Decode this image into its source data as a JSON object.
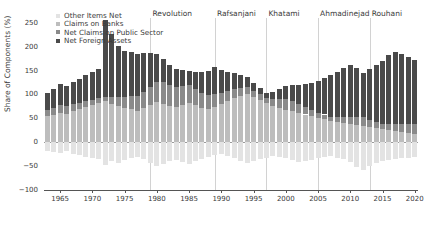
{
  "chart_data": {
    "type": "bar",
    "subtype": "stacked-bar",
    "title": "",
    "xlabel": "",
    "ylabel": "Share of Components (%)",
    "ylim": [
      -100,
      260
    ],
    "yticks": [
      -100,
      -50,
      0,
      50,
      100,
      150,
      200,
      250
    ],
    "xlim": [
      1962.5,
      2020.5
    ],
    "xticks": [
      1965,
      1970,
      1975,
      1980,
      1985,
      1990,
      1995,
      2000,
      2005,
      2010,
      2015,
      2020
    ],
    "grid": false,
    "legend_position": "top-left",
    "colors": {
      "other_items_net": "#e3e3e3",
      "claims_on_banks": "#bdbdbd",
      "net_claims_public_sector": "#8a8a8a",
      "net_foreign_assets": "#4a4a4a",
      "axis": "#555555",
      "era_line": "#d2d2d2",
      "text": "#3a3a3a"
    },
    "series": [
      {
        "name": "Other Items Net",
        "key": "other_items_net",
        "values": [
          -18,
          -20,
          -22,
          -19,
          -24,
          -26,
          -30,
          -33,
          -36,
          -48,
          -40,
          -44,
          -38,
          -34,
          -30,
          -36,
          -44,
          -50,
          -46,
          -40,
          -38,
          -42,
          -46,
          -40,
          -36,
          -30,
          -26,
          -24,
          -28,
          -34,
          -40,
          -44,
          -40,
          -36,
          -32,
          -28,
          -30,
          -34,
          -38,
          -42,
          -40,
          -38,
          -34,
          -30,
          -28,
          -32,
          -36,
          -42,
          -52,
          -58,
          -50,
          -44,
          -40,
          -38,
          -36,
          -34,
          -32,
          -30
        ]
      },
      {
        "name": "Claims on Banks",
        "key": "claims_on_banks",
        "values": [
          55,
          58,
          62,
          60,
          66,
          70,
          74,
          78,
          82,
          86,
          80,
          76,
          72,
          70,
          66,
          72,
          78,
          84,
          80,
          76,
          74,
          78,
          82,
          78,
          72,
          70,
          74,
          80,
          86,
          92,
          96,
          100,
          94,
          88,
          82,
          76,
          72,
          68,
          66,
          62,
          58,
          54,
          50,
          48,
          44,
          42,
          40,
          38,
          36,
          34,
          32,
          30,
          28,
          26,
          24,
          22,
          20,
          18
        ]
      },
      {
        "name": "Net Claims on Public Sector",
        "key": "net_claims_public_sector",
        "values": [
          12,
          14,
          16,
          15,
          14,
          13,
          12,
          11,
          10,
          9,
          14,
          18,
          22,
          26,
          30,
          34,
          38,
          42,
          46,
          44,
          42,
          40,
          38,
          34,
          30,
          28,
          26,
          24,
          22,
          20,
          18,
          16,
          14,
          12,
          10,
          14,
          18,
          22,
          20,
          18,
          16,
          14,
          12,
          10,
          8,
          10,
          12,
          14,
          16,
          18,
          14,
          12,
          10,
          12,
          14,
          16,
          18,
          20
        ]
      },
      {
        "name": "Net Foreign Assets",
        "key": "net_foreign_assets",
        "values": [
          36,
          40,
          44,
          42,
          46,
          50,
          54,
          58,
          62,
          160,
          132,
          108,
          96,
          92,
          88,
          80,
          70,
          58,
          48,
          42,
          38,
          34,
          30,
          36,
          44,
          52,
          58,
          48,
          40,
          32,
          26,
          20,
          16,
          14,
          12,
          16,
          22,
          28,
          34,
          40,
          48,
          56,
          66,
          76,
          88,
          96,
          104,
          110,
          104,
          92,
          108,
          120,
          132,
          144,
          150,
          146,
          140,
          134
        ]
      }
    ],
    "years": [
      1963,
      1964,
      1965,
      1966,
      1967,
      1968,
      1969,
      1970,
      1971,
      1972,
      1973,
      1974,
      1975,
      1976,
      1977,
      1978,
      1979,
      1980,
      1981,
      1982,
      1983,
      1984,
      1985,
      1986,
      1987,
      1988,
      1989,
      1990,
      1991,
      1992,
      1993,
      1994,
      1995,
      1996,
      1997,
      1998,
      1999,
      2000,
      2001,
      2002,
      2003,
      2004,
      2005,
      2006,
      2007,
      2008,
      2009,
      2010,
      2011,
      2012,
      2013,
      2014,
      2015,
      2016,
      2017,
      2018,
      2019,
      2020
    ],
    "eras": [
      {
        "label": "Revolution",
        "year": 1979
      },
      {
        "label": "Rafsanjani",
        "year": 1989
      },
      {
        "label": "Khatami",
        "year": 1997
      },
      {
        "label": "Ahmadinejad",
        "year": 2005
      },
      {
        "label": "Rouhani",
        "year": 2013
      }
    ],
    "legend": [
      {
        "label": "Other Items Net",
        "color": "#e3e3e3"
      },
      {
        "label": "Claims on Banks",
        "color": "#bdbdbd"
      },
      {
        "label": "Net Claims on Public Sector",
        "color": "#8a8a8a"
      },
      {
        "label": "Net Foreign Assets",
        "color": "#4a4a4a"
      }
    ]
  }
}
